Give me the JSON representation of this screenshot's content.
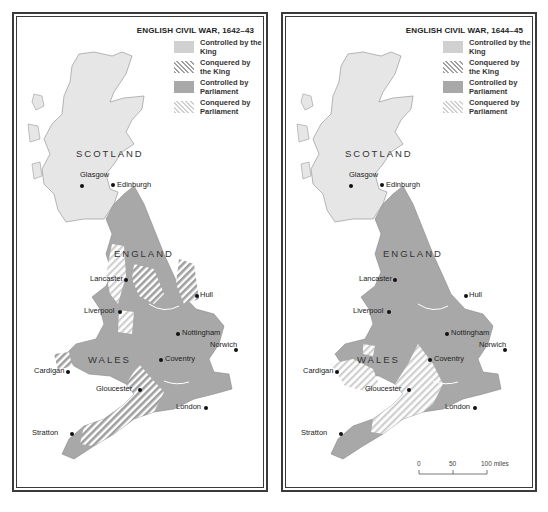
{
  "colors": {
    "scotland_fill": "#e6e6e6",
    "controlled_king": "#d0d0d0",
    "controlled_parliament": "#a8a8a8",
    "hatch_line": "#a0a0a0",
    "border": "#3a3a3a",
    "background": "#ffffff"
  },
  "legend": [
    {
      "id": "controlled-king",
      "label": "Controlled by the King",
      "style": "solid-light"
    },
    {
      "id": "conquered-king",
      "label": "Conquered by the King",
      "style": "hatch-dark"
    },
    {
      "id": "controlled-parliament",
      "label": "Controlled by Parliament",
      "style": "solid-dark"
    },
    {
      "id": "conquered-parliament",
      "label": "Conquered by Parliament",
      "style": "hatch-light"
    }
  ],
  "maps": [
    {
      "title": "ENGLISH CIVIL WAR, 1642–43",
      "countries": {
        "scotland": "SCOTLAND",
        "england": "ENGLAND",
        "wales": "WALES"
      },
      "cities": [
        "Glasgow",
        "Edinburgh",
        "Lancaster",
        "Hull",
        "Liverpool",
        "Nottingham",
        "Norwich",
        "Cardigan",
        "Coventry",
        "Gloucester",
        "London",
        "Stratton"
      ]
    },
    {
      "title": "ENGLISH CIVIL WAR, 1644–45",
      "countries": {
        "scotland": "SCOTLAND",
        "england": "ENGLAND",
        "wales": "WALES"
      },
      "cities": [
        "Glasgow",
        "Edinburgh",
        "Lancaster",
        "Hull",
        "Liverpool",
        "Nottingham",
        "Norwich",
        "Cardigan",
        "Coventry",
        "Gloucester",
        "London",
        "Stratton"
      ],
      "scale": {
        "ticks": [
          "0",
          "50",
          "100 miles"
        ]
      }
    }
  ]
}
